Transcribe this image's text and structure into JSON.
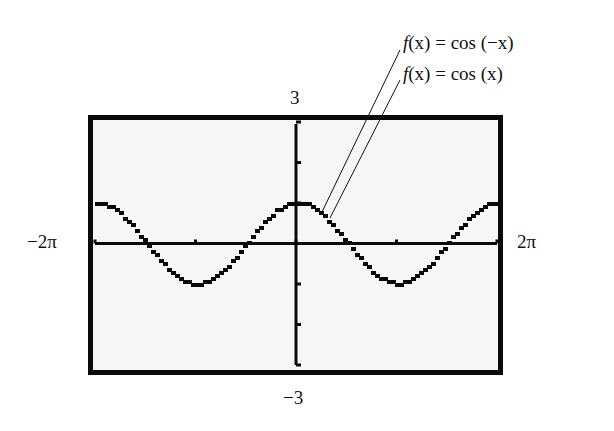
{
  "chart_data": {
    "type": "line",
    "title": "",
    "xlabel": "",
    "ylabel": "",
    "xlim_labels": [
      "-2π",
      "2π"
    ],
    "ylim_labels": [
      "-3",
      "3"
    ],
    "xlim": [
      -6.2832,
      6.2832
    ],
    "ylim": [
      -3,
      3
    ],
    "xscl": 3.1416,
    "yscl": 1,
    "grid": false,
    "series": [
      {
        "name": "f(x) = cos (-x)",
        "function": "cos(-x)"
      },
      {
        "name": "f(x) = cos (x)",
        "function": "cos(x)"
      }
    ],
    "sample_points": {
      "x": [
        -6.2832,
        -4.7124,
        -3.1416,
        -1.5708,
        0,
        1.5708,
        3.1416,
        4.7124,
        6.2832
      ],
      "y": [
        1,
        0,
        -1,
        0,
        1,
        0,
        -1,
        0,
        1
      ]
    },
    "annotations": [
      {
        "text": "f(x) = cos (−x)",
        "target": "curve near x=0.5"
      },
      {
        "text": "f(x) = cos (x)",
        "target": "curve near x=0.8"
      }
    ]
  },
  "labels": {
    "ymax": "3",
    "ymin": "−3",
    "xmin": "−2π",
    "xmax": "2π",
    "legend1_f": "f",
    "legend1_rest": "(x) = cos (−x)",
    "legend2_f": "f",
    "legend2_rest": "(x) = cos (x)"
  },
  "colors": {
    "ink": "#0a0a0a",
    "screen": "#f6f6f6",
    "background": "#ffffff"
  }
}
